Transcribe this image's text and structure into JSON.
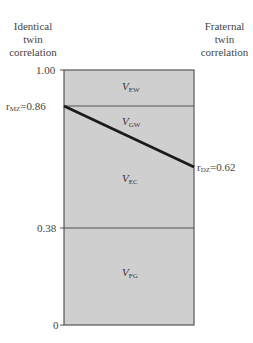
{
  "headers": {
    "left": [
      "Identical",
      "twin",
      "correlation"
    ],
    "right": [
      "Fraternal",
      "twin",
      "correlation"
    ]
  },
  "axis": {
    "ticks": [
      {
        "value": 1.0,
        "label": "1.00"
      },
      {
        "value": 0.38,
        "label": "0.38"
      },
      {
        "value": 0,
        "label": "0"
      }
    ]
  },
  "correlations": {
    "mz": {
      "prefix": "r",
      "sub": "MZ",
      "value_text": "=0.86",
      "value": 0.86
    },
    "dz": {
      "prefix": "r",
      "sub": "DZ",
      "value_text": "=0.62",
      "value": 0.62
    }
  },
  "regions": [
    {
      "main": "V",
      "sub": "EW",
      "description": "top band between 1.00 and 0.86"
    },
    {
      "main": "V",
      "sub": "GW",
      "description": "triangle between 0.86 (MZ) line and MZ-DZ diagonal"
    },
    {
      "main": "V",
      "sub": "EC",
      "description": "band below diagonal down to 0.38"
    },
    {
      "main": "V",
      "sub": "FG",
      "description": "bottom band from 0.38 to 0"
    }
  ],
  "colors": {
    "fill": "#cfcfcf",
    "border": "#555555",
    "diagonal": "#1a1a1a"
  }
}
